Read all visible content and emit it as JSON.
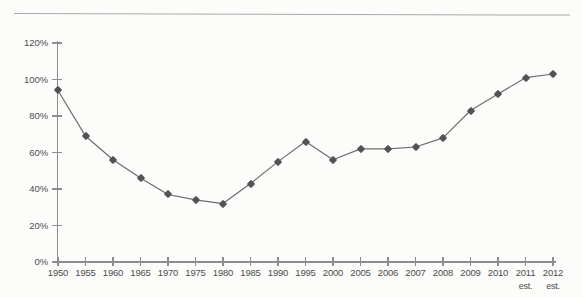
{
  "page": {
    "background_color": "#fcfcfa",
    "rule_color": "#a8a8a8"
  },
  "chart_data": {
    "type": "line",
    "title": "",
    "subtitle": "",
    "xlabel": "",
    "ylabel": "",
    "categories": [
      "1950",
      "1955",
      "1960",
      "1965",
      "1970",
      "1975",
      "1980",
      "1985",
      "1990",
      "1995",
      "2000",
      "2005",
      "2006",
      "2007",
      "2008",
      "2009",
      "2010",
      "2011",
      "2012"
    ],
    "category_sublabels": [
      "",
      "",
      "",
      "",
      "",
      "",
      "",
      "",
      "",
      "",
      "",
      "",
      "",
      "",
      "",
      "",
      "",
      "est.",
      "est."
    ],
    "values": [
      94,
      69,
      56,
      46,
      37,
      34,
      32,
      43,
      55,
      66,
      56,
      62,
      62,
      63,
      68,
      83,
      92,
      101,
      103
    ],
    "value_unit": "%",
    "ylim": [
      0,
      120
    ],
    "ytick_values": [
      0,
      20,
      40,
      60,
      80,
      100,
      120
    ],
    "ytick_labels": [
      "0%",
      "20%",
      "40%",
      "60%",
      "80%",
      "100%",
      "120%"
    ],
    "grid": false,
    "legend": "none",
    "series": [
      {
        "name": "",
        "line_color": "#6d6d6d",
        "marker_color": "#535353",
        "marker_shape": "diamond",
        "values": [
          94,
          69,
          56,
          46,
          37,
          34,
          32,
          43,
          55,
          66,
          56,
          62,
          62,
          63,
          68,
          83,
          92,
          101,
          103
        ]
      }
    ]
  }
}
